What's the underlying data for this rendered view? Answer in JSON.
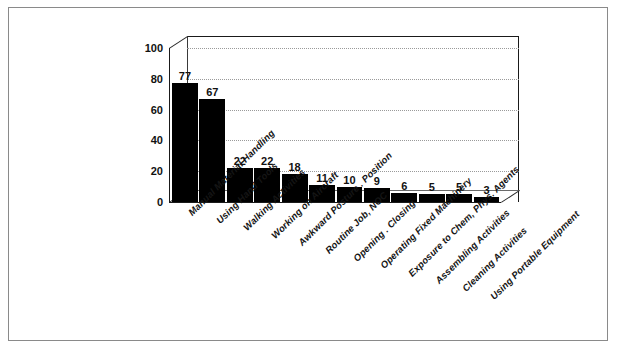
{
  "chart_data": {
    "type": "bar",
    "title": "",
    "xlabel": "",
    "ylabel": "",
    "ylim": [
      0,
      100
    ],
    "yticks": [
      0,
      20,
      40,
      60,
      80,
      100
    ],
    "grid": true,
    "legend": "none",
    "orientation": "vertical",
    "style": "3d-bar-black",
    "categories": [
      "Manual Material Handling",
      "Using Hand Tools",
      "Walking Activities",
      "Working on Aircraft",
      "Awkward Posture . Position",
      "Routine Job, NOC",
      "Opening . Closing",
      "Operating Fixed Machinery",
      "Exposure to Chem, Phys. Agents",
      "Assembling Activities",
      "Cleaning Activities",
      "Using Portable Equipment"
    ],
    "values": [
      77,
      67,
      22,
      22,
      18,
      11,
      10,
      9,
      6,
      5,
      5,
      3
    ],
    "value_labels": [
      "77",
      "67",
      "22",
      "22",
      "18",
      "11",
      "10",
      "9",
      "6",
      "5",
      "5",
      "3"
    ],
    "colors": {
      "bar": "#000000",
      "axis": "#1a1a1a",
      "grid": "#9a9a9a",
      "background": "#ffffff",
      "frame": "#8a8a8a"
    }
  },
  "axis": {
    "y_tick_labels": [
      "100",
      "80",
      "60",
      "40",
      "20",
      "0"
    ]
  }
}
